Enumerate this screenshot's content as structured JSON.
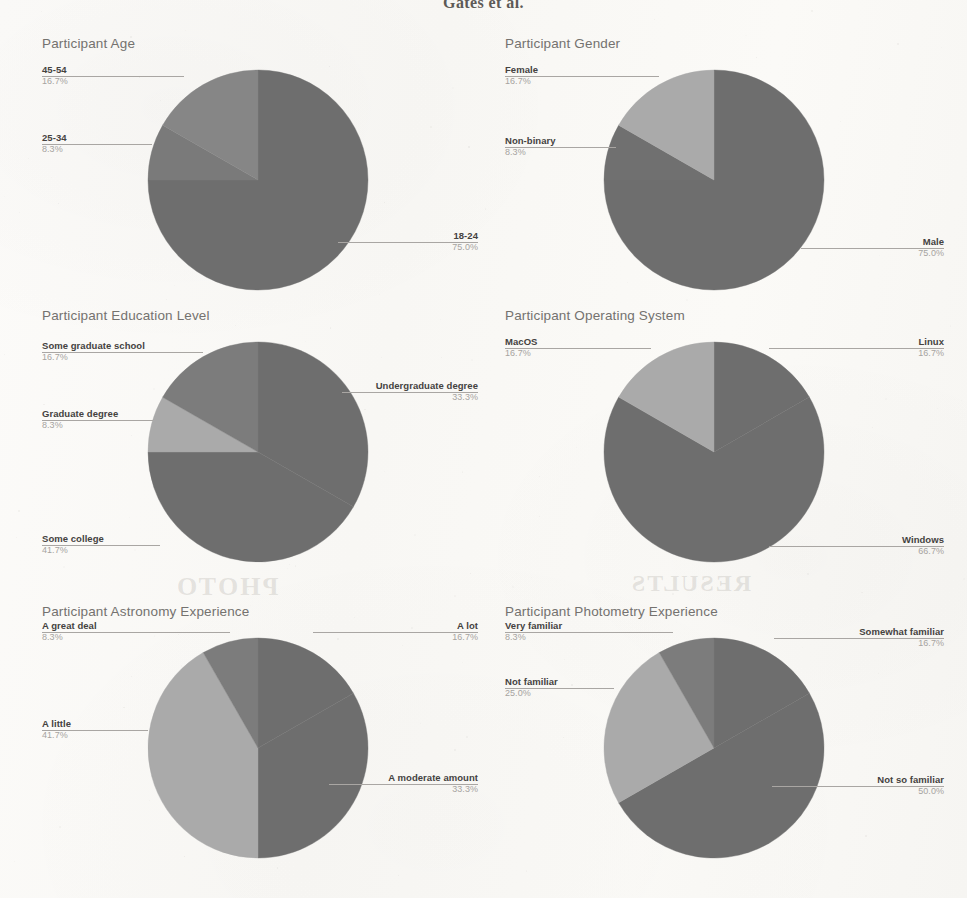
{
  "page": {
    "running_head": "Gates et al.",
    "ghost_marks": [
      "PHOTO",
      "RESULTS"
    ]
  },
  "charts": [
    {
      "id": "participant-age",
      "title": "Participant Age",
      "chart_data": {
        "type": "pie",
        "title": "Participant Age",
        "categories": [
          "18-24",
          "25-34",
          "45-54"
        ],
        "values": [
          75.0,
          8.3,
          16.7
        ],
        "labels": [
          "75.0%",
          "8.3%",
          "16.7%"
        ],
        "colors": [
          "#6e6e6e",
          "#7a7a7a",
          "#868686"
        ],
        "legend": "none",
        "grid": false
      },
      "callouts": [
        {
          "name": "45-54",
          "percent": "16.7%",
          "side": "left"
        },
        {
          "name": "25-34",
          "percent": "8.3%",
          "side": "left"
        },
        {
          "name": "18-24",
          "percent": "75.0%",
          "side": "right"
        }
      ]
    },
    {
      "id": "participant-gender",
      "title": "Participant Gender",
      "chart_data": {
        "type": "pie",
        "title": "Participant Gender",
        "categories": [
          "Male",
          "Non-binary",
          "Female"
        ],
        "values": [
          75.0,
          8.3,
          16.7
        ],
        "labels": [
          "75.0%",
          "8.3%",
          "16.7%"
        ],
        "colors": [
          "#6e6e6e",
          "#707070",
          "#aaaaaa"
        ],
        "legend": "none",
        "grid": false
      },
      "callouts": [
        {
          "name": "Female",
          "percent": "16.7%",
          "side": "left"
        },
        {
          "name": "Non-binary",
          "percent": "8.3%",
          "side": "left"
        },
        {
          "name": "Male",
          "percent": "75.0%",
          "side": "right"
        }
      ]
    },
    {
      "id": "participant-education-level",
      "title": "Participant Education Level",
      "chart_data": {
        "type": "pie",
        "title": "Participant Education Level",
        "categories": [
          "Undergraduate degree",
          "Some college",
          "Graduate degree",
          "Some graduate school"
        ],
        "values": [
          33.3,
          41.7,
          8.3,
          16.7
        ],
        "labels": [
          "33.3%",
          "41.7%",
          "8.3%",
          "16.7%"
        ],
        "colors": [
          "#6e6e6e",
          "#6e6e6e",
          "#aaaaaa",
          "#7c7c7c"
        ],
        "legend": "none",
        "grid": false
      },
      "callouts": [
        {
          "name": "Some graduate school",
          "percent": "16.7%",
          "side": "left"
        },
        {
          "name": "Undergraduate degree",
          "percent": "33.3%",
          "side": "right"
        },
        {
          "name": "Graduate degree",
          "percent": "8.3%",
          "side": "left"
        },
        {
          "name": "Some college",
          "percent": "41.7%",
          "side": "left"
        }
      ]
    },
    {
      "id": "participant-operating-system",
      "title": "Participant Operating System",
      "chart_data": {
        "type": "pie",
        "title": "Participant Operating System",
        "categories": [
          "Linux",
          "Windows",
          "MacOS"
        ],
        "values": [
          16.7,
          66.7,
          16.7
        ],
        "labels": [
          "16.7%",
          "66.7%",
          "16.7%"
        ],
        "colors": [
          "#6e6e6e",
          "#6e6e6e",
          "#aaaaaa"
        ],
        "legend": "none",
        "grid": false
      },
      "callouts": [
        {
          "name": "MacOS",
          "percent": "16.7%",
          "side": "left"
        },
        {
          "name": "Linux",
          "percent": "16.7%",
          "side": "right"
        },
        {
          "name": "Windows",
          "percent": "66.7%",
          "side": "right"
        }
      ]
    },
    {
      "id": "participant-astronomy-experience",
      "title": "Participant Astronomy Experience",
      "chart_data": {
        "type": "pie",
        "title": "Participant Astronomy Experience",
        "categories": [
          "A lot",
          "A moderate amount",
          "A little",
          "A great deal"
        ],
        "values": [
          16.7,
          33.3,
          41.7,
          8.3
        ],
        "labels": [
          "16.7%",
          "33.3%",
          "41.7%",
          "8.3%"
        ],
        "colors": [
          "#6e6e6e",
          "#6e6e6e",
          "#aaaaaa",
          "#7c7c7c"
        ],
        "legend": "none",
        "grid": false
      },
      "callouts": [
        {
          "name": "A great deal",
          "percent": "8.3%",
          "side": "left"
        },
        {
          "name": "A lot",
          "percent": "16.7%",
          "side": "right"
        },
        {
          "name": "A little",
          "percent": "41.7%",
          "side": "left"
        },
        {
          "name": "A moderate amount",
          "percent": "33.3%",
          "side": "right"
        }
      ]
    },
    {
      "id": "participant-photometry-experience",
      "title": "Participant Photometry Experience",
      "chart_data": {
        "type": "pie",
        "title": "Participant Photometry Experience",
        "categories": [
          "Somewhat familiar",
          "Not so familiar",
          "Not familiar",
          "Very familiar"
        ],
        "values": [
          16.7,
          50.0,
          25.0,
          8.3
        ],
        "labels": [
          "16.7%",
          "50.0%",
          "25.0%",
          "8.3%"
        ],
        "colors": [
          "#6e6e6e",
          "#6e6e6e",
          "#aaaaaa",
          "#7c7c7c"
        ],
        "legend": "none",
        "grid": false
      },
      "callouts": [
        {
          "name": "Very familiar",
          "percent": "8.3%",
          "side": "left"
        },
        {
          "name": "Somewhat familiar",
          "percent": "16.7%",
          "side": "right"
        },
        {
          "name": "Not familiar",
          "percent": "25.0%",
          "side": "left"
        },
        {
          "name": "Not so familiar",
          "percent": "50.0%",
          "side": "right"
        }
      ]
    }
  ]
}
